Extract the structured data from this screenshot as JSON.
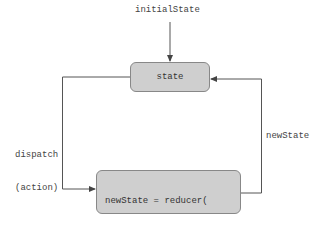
{
  "diagram": {
    "nodes": {
      "state": {
        "label": "state"
      },
      "reducer": {
        "line1": "newState = reducer(",
        "line2": "  oldState, action",
        "line3": ")"
      }
    },
    "labels": {
      "initial_state": "initialState",
      "dispatch_line1": "dispatch",
      "dispatch_line2": "(action)",
      "new_state": "newState"
    },
    "edges": [
      {
        "from": "initialState",
        "to": "state"
      },
      {
        "from": "state",
        "to": "reducer",
        "label": "dispatch (action)"
      },
      {
        "from": "reducer",
        "to": "state",
        "label": "newState"
      }
    ],
    "colors": {
      "box_fill": "#cfcfcf",
      "box_border": "#888888",
      "line": "#555555",
      "text": "#444444"
    }
  }
}
